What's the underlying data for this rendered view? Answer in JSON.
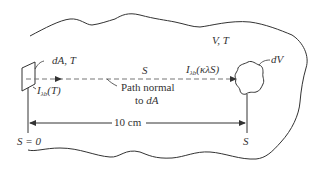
{
  "diagram": {
    "colors": {
      "stroke": "#333333",
      "dash": "#777777",
      "background": "#ffffff"
    },
    "labels": {
      "enclosure": "V, T",
      "surface_element": "dA, T",
      "emitted_intensity": "I",
      "emitted_intensity_sub": "λb",
      "emitted_intensity_arg": "(T)",
      "path_variable": "S",
      "arrived_intensity": "I",
      "arrived_intensity_sub": "λb",
      "arrived_intensity_arg": "(κλS)",
      "volume_element": "dV",
      "path_note_line1": "Path normal",
      "path_note_line2_prefix": "to ",
      "path_note_line2_var": "dA",
      "distance": "10 cm",
      "start_position": "S = 0",
      "end_position": "S"
    }
  }
}
